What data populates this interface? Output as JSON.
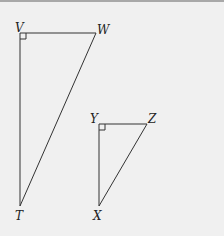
{
  "diagram": {
    "type": "two right triangles",
    "background_color": "#f0f0f0",
    "line_color": "#333333",
    "triangles": [
      {
        "name": "triangle-TVW",
        "right_angle_at": "V",
        "vertices": {
          "V": {
            "label": "V",
            "x": 20,
            "y": 33
          },
          "W": {
            "label": "W",
            "x": 96,
            "y": 33
          },
          "T": {
            "label": "T",
            "x": 20,
            "y": 206
          }
        }
      },
      {
        "name": "triangle-XYZ",
        "right_angle_at": "Y",
        "vertices": {
          "Y": {
            "label": "Y",
            "x": 99,
            "y": 124
          },
          "Z": {
            "label": "Z",
            "x": 147,
            "y": 124
          },
          "X": {
            "label": "X",
            "x": 99,
            "y": 206
          }
        }
      }
    ]
  }
}
